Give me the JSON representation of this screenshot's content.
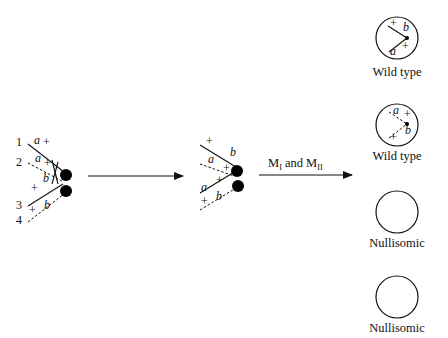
{
  "diagram": {
    "stage1": {
      "chromatid_numbers": [
        "1",
        "2",
        "3",
        "4"
      ],
      "labels": {
        "c1_a": "a",
        "c1_plus": "+",
        "c2_a": "a",
        "c2_plus": "+",
        "c2_b": "b",
        "c3_plus": "+",
        "c4_plus": "+",
        "c4_b": "b"
      }
    },
    "stage2": {
      "labels": {
        "c1_plus": "+",
        "c1_b": "b",
        "c2_a": "a",
        "c2_plus": "+",
        "c3_plus": "+",
        "c3_a": "a",
        "c4_plus": "+",
        "c4_b": "b"
      }
    },
    "arrow2_label": {
      "m": "M",
      "sub1": "I",
      "and": " and ",
      "m2": "M",
      "sub2": "II"
    },
    "products": [
      {
        "caption": "Wild type",
        "labels": [
          "+",
          "b",
          "a",
          "+"
        ]
      },
      {
        "caption": "Wild type",
        "labels": [
          "a",
          "+",
          "b",
          "+"
        ]
      },
      {
        "caption": "Nullisomic"
      },
      {
        "caption": "Nullisomic"
      }
    ]
  }
}
